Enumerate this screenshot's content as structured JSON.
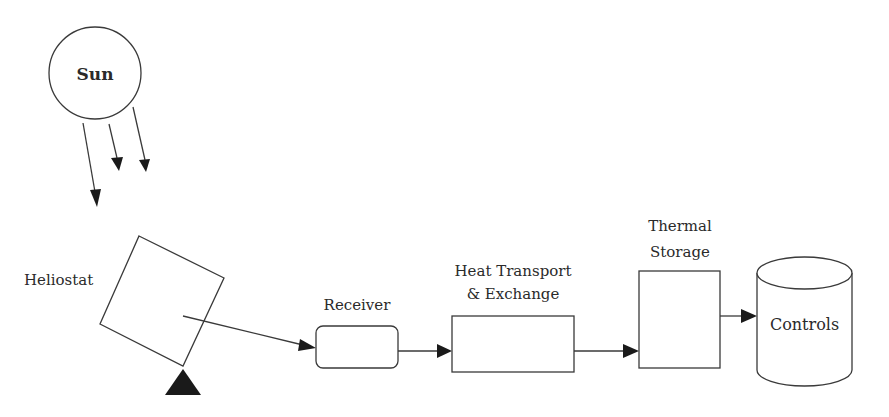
{
  "diagram": {
    "type": "solar power tower block diagram",
    "nodes": {
      "sun": {
        "label": "Sun"
      },
      "heliostat": {
        "label": "Heliostat"
      },
      "receiver": {
        "label": "Receiver"
      },
      "heat_exchange": {
        "label_line1": "Heat Transport",
        "label_line2": "& Exchange"
      },
      "thermal_storage": {
        "label_line1": "Thermal",
        "label_line2": "Storage"
      },
      "controls": {
        "label": "Controls"
      }
    },
    "edges": [
      {
        "from": "sun",
        "to": "heliostat",
        "kind": "sun-rays",
        "count": 3
      },
      {
        "from": "heliostat",
        "to": "receiver"
      },
      {
        "from": "receiver",
        "to": "heat_exchange"
      },
      {
        "from": "heat_exchange",
        "to": "thermal_storage"
      },
      {
        "from": "thermal_storage",
        "to": "controls"
      }
    ]
  }
}
